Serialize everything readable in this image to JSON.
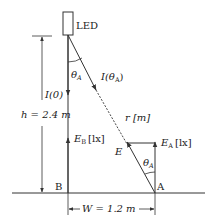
{
  "diagram": {
    "type": "illuminance-geometry",
    "colors": {
      "line": "#333333",
      "background": "#ffffff"
    },
    "light_source": {
      "label": "LED"
    },
    "labels": {
      "theta_top": "θ",
      "theta_top_sub": "A",
      "intensity_angle": "I(θ",
      "intensity_angle_sub": "A",
      "intensity_angle_close": ")",
      "intensity_zero": "I(0)",
      "height": "h = 2.4 m",
      "distance": "r [m]",
      "E_B": "E",
      "E_B_sub": "B",
      "E_B_unit": "[lx]",
      "E": "E",
      "E_A": "E",
      "E_A_sub": "A",
      "E_A_unit": "[lx]",
      "theta_bottom": "θ",
      "theta_bottom_sub": "A",
      "point_A": "A",
      "point_B": "B",
      "width": "W = 1.2 m"
    },
    "values": {
      "h_m": 2.4,
      "W_m": 1.2
    }
  }
}
